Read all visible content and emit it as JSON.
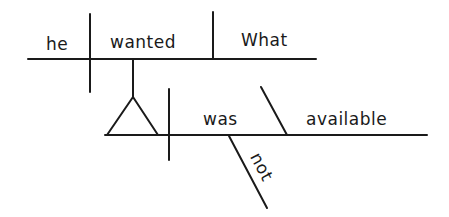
{
  "diagram": {
    "type": "sentence-diagram",
    "style": "Reed-Kellogg",
    "sentence": "he wanted What was not available",
    "line_color": "#1a1a1a",
    "text_color": "#1a1a1a",
    "main_clause": {
      "subject": "he",
      "verb": "wanted",
      "direct_object": "What"
    },
    "noun_clause": {
      "role": "object clause on pedestal",
      "subject_slot": "(empty, triangle pedestal)",
      "verb": "was",
      "predicate_adjective": "available",
      "modifier": "not"
    }
  }
}
